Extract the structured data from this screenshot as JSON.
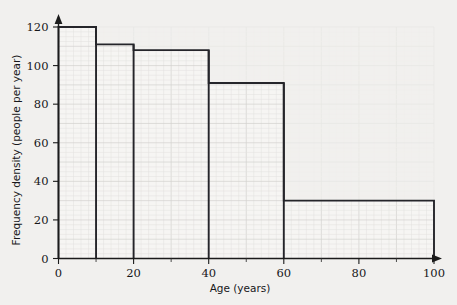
{
  "chart_data": {
    "type": "bar",
    "subtype": "histogram",
    "title": "",
    "xlabel": "Age (years)",
    "ylabel": "Frequency density (people per year)",
    "xlim": [
      0,
      100
    ],
    "ylim": [
      0,
      120
    ],
    "grid": true,
    "legend": null,
    "x_ticks": [
      0,
      20,
      40,
      60,
      80,
      100
    ],
    "x_tick_labels": [
      "0",
      "20",
      "40",
      "60",
      "80",
      "100"
    ],
    "x_minor_tick_step": 10,
    "y_ticks": [
      0,
      20,
      40,
      60,
      80,
      100,
      120
    ],
    "y_tick_labels": [
      "0",
      "20",
      "40",
      "60",
      "80",
      "100",
      "120"
    ],
    "bins": [
      {
        "label": "0-10",
        "x_start": 0,
        "x_end": 10,
        "frequency_density": 120
      },
      {
        "label": "10-20",
        "x_start": 10,
        "x_end": 20,
        "frequency_density": 111
      },
      {
        "label": "20-40",
        "x_start": 20,
        "x_end": 40,
        "frequency_density": 108
      },
      {
        "label": "40-60",
        "x_start": 40,
        "x_end": 60,
        "frequency_density": 91
      },
      {
        "label": "60-100",
        "x_start": 60,
        "x_end": 100,
        "frequency_density": 30
      }
    ],
    "categories": [
      "0-10",
      "10-20",
      "20-40",
      "40-60",
      "60-100"
    ],
    "values": [
      120,
      111,
      108,
      91,
      30
    ],
    "colors": {
      "background": "#f1f0ee",
      "plot_background": "#fbfbfa",
      "bar_outline": "#25252a",
      "bar_fill": "#f6f5f3",
      "axis": "#1b1b1b",
      "grid_minor": "#e2e1df",
      "grid_major": "#d2d1cf",
      "text": "#17171a"
    }
  }
}
